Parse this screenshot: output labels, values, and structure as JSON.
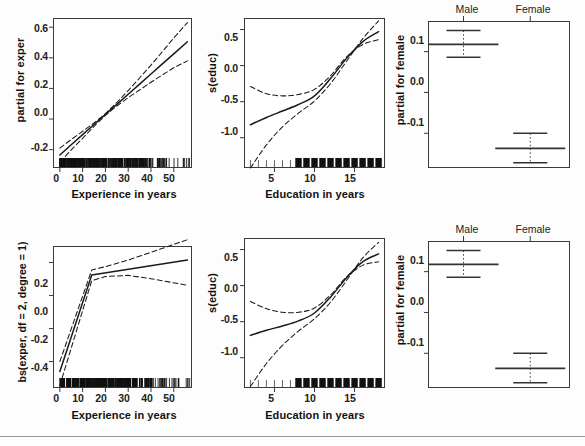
{
  "figure": {
    "type": "statistical-effect-plot-grid",
    "rows": 2,
    "cols": 3,
    "background": "#fdfdfd",
    "line_color": "#1a1a1a",
    "frame_color": "#3a3a3a"
  },
  "chart_data": [
    {
      "id": "top-left",
      "type": "line",
      "title": "",
      "xlabel": "Experience in years",
      "ylabel": "partial for exper",
      "xlim": [
        -3,
        58
      ],
      "ylim": [
        -0.32,
        0.66
      ],
      "xticks": [
        "0",
        "10",
        "20",
        "30",
        "40",
        "50"
      ],
      "xtickvals": [
        0,
        10,
        20,
        30,
        40,
        50
      ],
      "yticks": [
        "0.6",
        "0.4",
        "0.2",
        "0.0",
        "-0.2"
      ],
      "ytickvals": [
        0.6,
        0.4,
        0.2,
        0.0,
        -0.2
      ],
      "grid": false,
      "legend": "none",
      "rug": true,
      "series": [
        {
          "name": "fit",
          "style": "solid",
          "x": [
            0,
            5,
            10,
            15,
            20,
            25,
            30,
            35,
            40,
            45,
            50,
            56
          ],
          "values": [
            -0.235,
            -0.168,
            -0.102,
            -0.036,
            0.03,
            0.096,
            0.162,
            0.228,
            0.294,
            0.36,
            0.426,
            0.505
          ]
        },
        {
          "name": "upper-confidence-band",
          "style": "dashed",
          "x": [
            0,
            5,
            10,
            15,
            20,
            25,
            30,
            35,
            40,
            45,
            50,
            56
          ],
          "values": [
            -0.19,
            -0.134,
            -0.08,
            -0.026,
            0.035,
            0.108,
            0.186,
            0.268,
            0.352,
            0.44,
            0.53,
            0.63
          ]
        },
        {
          "name": "lower-confidence-band",
          "style": "dashed",
          "x": [
            0,
            5,
            10,
            15,
            20,
            25,
            30,
            35,
            40,
            45,
            50,
            56
          ],
          "values": [
            -0.282,
            -0.202,
            -0.126,
            -0.048,
            0.024,
            0.085,
            0.14,
            0.19,
            0.24,
            0.288,
            0.335,
            0.38
          ]
        }
      ]
    },
    {
      "id": "top-middle",
      "type": "line",
      "title": "",
      "xlabel": "Education in years",
      "ylabel": "s(educ)",
      "xlim": [
        1.2,
        18.8
      ],
      "ylim": [
        -1.42,
        0.66
      ],
      "xticks": [
        "5",
        "10",
        "15"
      ],
      "xtickvals": [
        5,
        10,
        15
      ],
      "yticks": [
        "0.5",
        "0.0",
        "-0.5",
        "-1.0"
      ],
      "ytickvals": [
        0.5,
        0.0,
        -0.5,
        -1.0
      ],
      "grid": false,
      "legend": "none",
      "rug": true,
      "series": [
        {
          "name": "fit",
          "style": "solid",
          "x": [
            2,
            4,
            6,
            8,
            10,
            12,
            14,
            16,
            18
          ],
          "values": [
            -0.82,
            -0.72,
            -0.63,
            -0.54,
            -0.42,
            -0.18,
            0.1,
            0.33,
            0.47
          ]
        },
        {
          "name": "upper-confidence-band",
          "style": "dashed",
          "x": [
            2,
            4,
            6,
            8,
            10,
            12,
            14,
            16,
            18
          ],
          "values": [
            -0.29,
            -0.39,
            -0.42,
            -0.4,
            -0.33,
            -0.14,
            0.12,
            0.29,
            0.36
          ]
        },
        {
          "name": "lower-confidence-band",
          "style": "dashed",
          "x": [
            2,
            4,
            6,
            8,
            10,
            12,
            14,
            16,
            18
          ],
          "values": [
            -1.42,
            -1.1,
            -0.85,
            -0.66,
            -0.49,
            -0.25,
            0.06,
            0.37,
            0.62
          ]
        }
      ]
    },
    {
      "id": "top-right",
      "type": "scatter",
      "title": "",
      "xlabel": "",
      "ylabel": "partial for female",
      "categories": [
        "Male",
        "Female"
      ],
      "ylim": [
        -0.185,
        0.175
      ],
      "yticks": [
        "0.1",
        "0.0",
        "-0.1"
      ],
      "ytickvals": [
        0.1,
        0.0,
        -0.1
      ],
      "grid": false,
      "legend": "none",
      "values": [
        0.118,
        -0.137
      ],
      "ci_upper": [
        0.152,
        -0.1
      ],
      "ci_lower": [
        0.086,
        -0.172
      ]
    },
    {
      "id": "bottom-left",
      "type": "line",
      "title": "",
      "xlabel": "Experience in years",
      "ylabel": "bs(exper, df = 2, degree = 1)",
      "xlim": [
        -3,
        58
      ],
      "ylim": [
        -0.56,
        0.3
      ],
      "xticks": [
        "0",
        "10",
        "20",
        "30",
        "40",
        "50"
      ],
      "xtickvals": [
        0,
        10,
        20,
        30,
        40,
        50
      ],
      "yticks": [
        "0.2",
        "0.0",
        "-0.2",
        "-0.4"
      ],
      "ytickvals": [
        0.2,
        0.0,
        -0.2,
        -0.4
      ],
      "grid": false,
      "legend": "none",
      "rug": true,
      "knot": 14,
      "series": [
        {
          "name": "fit",
          "style": "solid",
          "x": [
            0,
            14,
            56
          ],
          "values": [
            -0.46,
            0.125,
            0.215
          ]
        },
        {
          "name": "upper-confidence-band",
          "style": "dashed",
          "x": [
            0,
            14,
            20,
            30,
            40,
            56
          ],
          "values": [
            -0.4,
            0.155,
            0.175,
            0.215,
            0.262,
            0.338
          ]
        },
        {
          "name": "lower-confidence-band",
          "style": "dashed",
          "x": [
            0,
            14,
            20,
            30,
            40,
            56
          ],
          "values": [
            -0.545,
            0.09,
            0.115,
            0.122,
            0.102,
            0.062
          ]
        }
      ]
    },
    {
      "id": "bottom-middle",
      "type": "line",
      "title": "",
      "xlabel": "Education in years",
      "ylabel": "s(educ)",
      "xlim": [
        1.2,
        18.8
      ],
      "ylim": [
        -1.42,
        0.66
      ],
      "xticks": [
        "5",
        "10",
        "15"
      ],
      "xtickvals": [
        5,
        10,
        15
      ],
      "yticks": [
        "0.5",
        "0.0",
        "-0.5",
        "-1.0"
      ],
      "ytickvals": [
        0.5,
        0.0,
        -0.5,
        -1.0
      ],
      "grid": false,
      "legend": "none",
      "rug": true,
      "series": [
        {
          "name": "fit",
          "style": "solid",
          "x": [
            2,
            4,
            6,
            8,
            10,
            12,
            14,
            16,
            18
          ],
          "values": [
            -0.69,
            -0.62,
            -0.56,
            -0.49,
            -0.38,
            -0.16,
            0.11,
            0.33,
            0.44
          ]
        },
        {
          "name": "upper-confidence-band",
          "style": "dashed",
          "x": [
            2,
            4,
            6,
            8,
            10,
            12,
            14,
            16,
            18
          ],
          "values": [
            -0.22,
            -0.32,
            -0.37,
            -0.37,
            -0.31,
            -0.13,
            0.12,
            0.28,
            0.33
          ]
        },
        {
          "name": "lower-confidence-band",
          "style": "dashed",
          "x": [
            2,
            4,
            6,
            8,
            10,
            12,
            14,
            16,
            18
          ],
          "values": [
            -1.4,
            -1.08,
            -0.83,
            -0.63,
            -0.46,
            -0.23,
            0.07,
            0.38,
            0.6
          ]
        }
      ]
    },
    {
      "id": "bottom-right",
      "type": "scatter",
      "title": "",
      "xlabel": "",
      "ylabel": "partial for female",
      "categories": [
        "Male",
        "Female"
      ],
      "ylim": [
        -0.185,
        0.175
      ],
      "yticks": [
        "0.1",
        "0.0",
        "-0.1"
      ],
      "ytickvals": [
        0.1,
        0.0,
        -0.1
      ],
      "grid": false,
      "legend": "none",
      "values": [
        0.118,
        -0.137
      ],
      "ci_upper": [
        0.152,
        -0.1
      ],
      "ci_lower": [
        0.086,
        -0.172
      ]
    }
  ],
  "panels": {
    "p1": {
      "ylabel": "partial for exper",
      "xlabel": "Experience in years",
      "yticks": [
        "0.6",
        "0.4",
        "0.2",
        "0.0",
        "-0.2"
      ],
      "xticks": [
        "0",
        "10",
        "20",
        "30",
        "40",
        "50"
      ]
    },
    "p2": {
      "ylabel": "s(educ)",
      "xlabel": "Education in years",
      "yticks": [
        "0.5",
        "0.0",
        "-0.5",
        "-1.0"
      ],
      "xticks": [
        "5",
        "10",
        "15"
      ]
    },
    "p3": {
      "ylabel": "partial for female",
      "yticks": [
        "0.1",
        "0.0",
        "-0.1"
      ],
      "categories": [
        "Male",
        "Female"
      ]
    },
    "p4": {
      "ylabel": "bs(exper, df = 2, degree = 1)",
      "xlabel": "Experience in years",
      "yticks": [
        "0.2",
        "0.0",
        "-0.2",
        "-0.4"
      ],
      "xticks": [
        "0",
        "10",
        "20",
        "30",
        "40",
        "50"
      ]
    },
    "p5": {
      "ylabel": "s(educ)",
      "xlabel": "Education in years",
      "yticks": [
        "0.5",
        "0.0",
        "-0.5",
        "-1.0"
      ],
      "xticks": [
        "5",
        "10",
        "15"
      ]
    },
    "p6": {
      "ylabel": "partial for female",
      "yticks": [
        "0.1",
        "0.0",
        "-0.1"
      ],
      "categories": [
        "Male",
        "Female"
      ]
    }
  }
}
